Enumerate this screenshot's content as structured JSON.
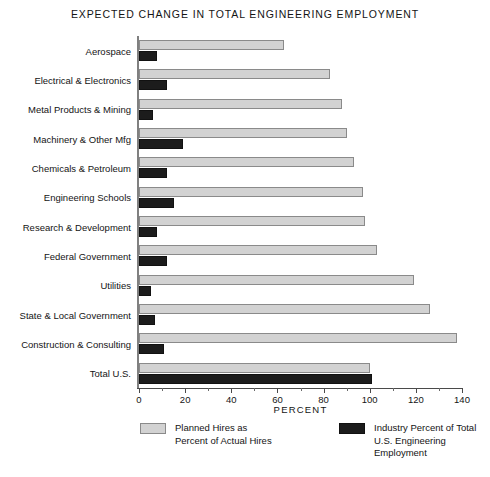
{
  "chart_data": {
    "type": "bar",
    "orientation": "horizontal",
    "title": "EXPECTED CHANGE IN TOTAL ENGINEERING EMPLOYMENT",
    "xlabel": "PERCENT",
    "ylabel": "",
    "xlim": [
      0,
      140
    ],
    "xticks": [
      0,
      20,
      40,
      60,
      80,
      100,
      120,
      140
    ],
    "xtick_labels": [
      "0",
      "20",
      "40",
      "60",
      "80",
      "100",
      "120",
      "140"
    ],
    "minor_tick_interval": 10,
    "grid": false,
    "legend_position": "below",
    "categories": [
      "Aerospace",
      "Electrical & Electronics",
      "Metal Products & Mining",
      "Machinery & Other Mfg",
      "Chemicals & Petroleum",
      "Engineering Schools",
      "Research & Development",
      "Federal Government",
      "Utilities",
      "State & Local Government",
      "Construction & Consulting",
      "Total U.S."
    ],
    "series": [
      {
        "name": "Planned Hires as\nPercent of Actual Hires",
        "color": "#d2d2d2",
        "values": [
          63,
          83,
          88,
          90,
          93,
          97,
          98,
          103,
          119,
          126,
          138,
          100
        ]
      },
      {
        "name": "Industry Percent of Total\nU.S. Engineering\nEmployment",
        "color": "#1c1c1c",
        "values": [
          8,
          12,
          6,
          19,
          12,
          15,
          8,
          12,
          5,
          7,
          11,
          101
        ]
      }
    ]
  },
  "legend": {
    "entries": [
      {
        "label": "Planned Hires as\nPercent of Actual Hires",
        "swatch": "light-gray-swatch"
      },
      {
        "label": "Industry Percent of Total\nU.S. Engineering\nEmployment",
        "swatch": "black-swatch"
      }
    ]
  },
  "colors": {
    "light_bar": "#d2d2d2",
    "light_bar_border": "#8a8a8a",
    "dark_bar": "#1c1c1c",
    "axis": "#4a4a4a",
    "text": "#141414",
    "background": "#ffffff"
  }
}
